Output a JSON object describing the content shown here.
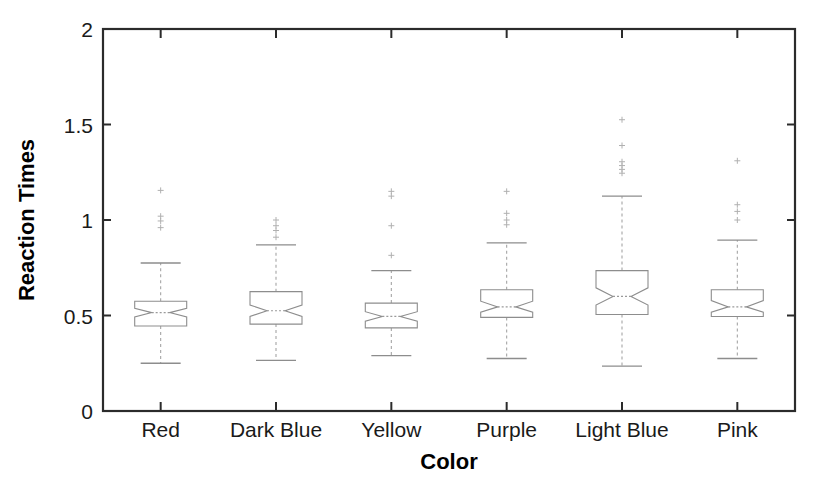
{
  "chart_data": {
    "type": "box",
    "title": "",
    "xlabel": "Color",
    "ylabel": "Reaction Times",
    "xlim": [
      0.5,
      6.5
    ],
    "ylim": [
      0,
      2
    ],
    "ytick_labels": [
      "0",
      "0.5",
      "1",
      "1.5",
      "2"
    ],
    "ytick_values": [
      0,
      0.5,
      1,
      1.5,
      2
    ],
    "grid": false,
    "legend": "none",
    "notched": true,
    "categories": [
      "Red",
      "Dark Blue",
      "Yellow",
      "Purple",
      "Light Blue",
      "Pink"
    ],
    "boxes": [
      {
        "label": "Red",
        "whisker_low": 0.25,
        "q1": 0.445,
        "median": 0.515,
        "q3": 0.575,
        "whisker_high": 0.775,
        "notch_low": 0.492,
        "notch_high": 0.538,
        "outliers": [
          0.96,
          0.995,
          1.02,
          1.155
        ]
      },
      {
        "label": "Dark Blue",
        "whisker_low": 0.265,
        "q1": 0.455,
        "median": 0.525,
        "q3": 0.625,
        "whisker_high": 0.87,
        "notch_low": 0.495,
        "notch_high": 0.555,
        "outliers": [
          0.91,
          0.945,
          0.97,
          1.0
        ]
      },
      {
        "label": "Yellow",
        "whisker_low": 0.29,
        "q1": 0.435,
        "median": 0.495,
        "q3": 0.565,
        "whisker_high": 0.735,
        "notch_low": 0.47,
        "notch_high": 0.52,
        "outliers": [
          0.815,
          0.97,
          1.125,
          1.15
        ]
      },
      {
        "label": "Purple",
        "whisker_low": 0.275,
        "q1": 0.49,
        "median": 0.545,
        "q3": 0.635,
        "whisker_high": 0.88,
        "notch_low": 0.518,
        "notch_high": 0.575,
        "outliers": [
          0.975,
          1.0,
          1.035,
          1.15
        ]
      },
      {
        "label": "Light Blue",
        "whisker_low": 0.235,
        "q1": 0.505,
        "median": 0.6,
        "q3": 0.735,
        "whisker_high": 1.125,
        "notch_low": 0.555,
        "notch_high": 0.645,
        "outliers": [
          1.245,
          1.265,
          1.285,
          1.305,
          1.39,
          1.525
        ]
      },
      {
        "label": "Pink",
        "whisker_low": 0.275,
        "q1": 0.495,
        "median": 0.545,
        "q3": 0.635,
        "whisker_high": 0.895,
        "notch_low": 0.518,
        "notch_high": 0.578,
        "outliers": [
          1.0,
          1.045,
          1.08,
          1.31
        ]
      }
    ],
    "colors": {
      "axis": "#2b2b2b",
      "box_stroke": "#8d8d8d",
      "whisker": "#a5a5a5",
      "median": "#9a9a9a",
      "outlier": "#b0b0b0",
      "background": "#ffffff"
    }
  }
}
